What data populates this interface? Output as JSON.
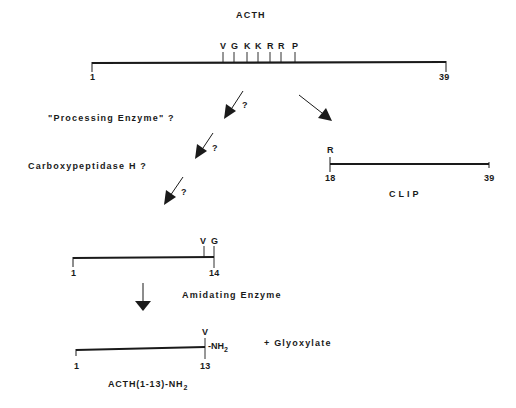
{
  "title": "ACTH",
  "acth": {
    "start": "1",
    "end": "39",
    "residues": [
      "V",
      "G",
      "K",
      "K",
      "R",
      "R",
      "P"
    ]
  },
  "steps": {
    "processing_enzyme": "\"Processing Enzyme\" ?",
    "carboxypeptidase": "Carboxypeptidase H ?",
    "amidating_enzyme": "Amidating Enzyme",
    "question": "?"
  },
  "clip": {
    "residue": "R",
    "start": "18",
    "end": "39",
    "label": "CLIP"
  },
  "intermediate": {
    "residues": [
      "V",
      "G"
    ],
    "start": "1",
    "end": "14"
  },
  "product": {
    "residue": "V",
    "start": "1",
    "end": "13",
    "amide_group": "-NH",
    "amide_sub": "2",
    "byproduct": "+ Glyoxylate",
    "name": "ACTH(1-13)-NH",
    "name_sub": "2"
  },
  "colors": {
    "ink": "#1a1a1a",
    "background": "#ffffff"
  }
}
